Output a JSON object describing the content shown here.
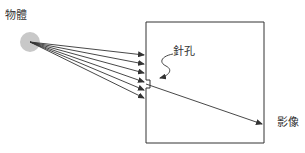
{
  "diagram": {
    "labels": {
      "object": "物體",
      "pinhole": "針孔",
      "image": "影像"
    },
    "colors": {
      "line": "#333333",
      "object_fill": "#c8c8c8",
      "background": "#ffffff"
    },
    "rays": [
      {
        "from": [
          30,
          42
        ],
        "to": [
          146,
          55
        ]
      },
      {
        "from": [
          30,
          42
        ],
        "to": [
          146,
          64
        ]
      },
      {
        "from": [
          30,
          42
        ],
        "to": [
          146,
          73
        ]
      },
      {
        "from": [
          30,
          42
        ],
        "to": [
          146,
          81
        ]
      },
      {
        "from": [
          30,
          42
        ],
        "to": [
          146,
          90
        ]
      },
      {
        "from": [
          30,
          42
        ],
        "to": [
          146,
          98
        ]
      }
    ],
    "image_ray": {
      "from": [
        146,
        84
      ],
      "to": [
        263,
        124
      ]
    }
  }
}
